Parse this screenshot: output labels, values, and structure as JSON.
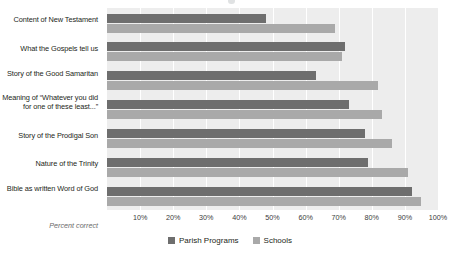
{
  "chart_data": {
    "type": "bar",
    "orientation": "horizontal",
    "title": "",
    "xlabel": "Percent correct",
    "ylabel": "",
    "xlim": [
      0,
      100
    ],
    "grid": true,
    "legend_position": "bottom-center",
    "categories": [
      "Content of New Testament",
      "What the Gospels tell us",
      "Story of the Good Samaritan",
      "Meaning of “Whatever you did for one of these least...”",
      "Story of the Prodigal Son",
      "Nature of the Trinity",
      "Bible as written Word of God"
    ],
    "tick_labels": [
      "10%",
      "20%",
      "30%",
      "40%",
      "50%",
      "60%",
      "70%",
      "80%",
      "90%",
      "100%"
    ],
    "tick_values": [
      10,
      20,
      30,
      40,
      50,
      60,
      70,
      80,
      90,
      100
    ],
    "series": [
      {
        "name": "Parish Programs",
        "color": "#6e6e6e",
        "values": [
          48,
          72,
          63,
          73,
          78,
          79,
          92
        ]
      },
      {
        "name": "Schools",
        "color": "#a9a9a9",
        "values": [
          69,
          71,
          82,
          83,
          86,
          91,
          95
        ]
      }
    ]
  },
  "axis": {
    "percent_correct_label": "Percent correct"
  },
  "colors": {
    "plot_background": "#ededed",
    "gridline": "#ffffff",
    "series_parish": "#6e6e6e",
    "series_schools": "#a9a9a9",
    "text": "#231f20"
  }
}
